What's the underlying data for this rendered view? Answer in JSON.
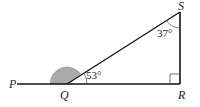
{
  "diagram": {
    "type": "geometry-triangle",
    "points": {
      "P": {
        "label": "P"
      },
      "Q": {
        "label": "Q"
      },
      "R": {
        "label": "R"
      },
      "S": {
        "label": "S"
      }
    },
    "angles": {
      "SQR": {
        "label": "53°"
      },
      "QSR": {
        "label": "37°"
      },
      "QRS": {
        "label": "right-angle"
      },
      "PQS": {
        "label": "",
        "shaded": true
      }
    },
    "colors": {
      "line": "#111111",
      "shade": "#aaaaaa"
    }
  }
}
